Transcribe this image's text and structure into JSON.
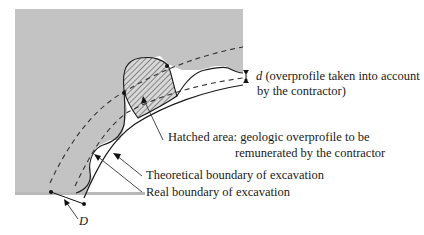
{
  "diagram": {
    "type": "excavation overprofile cross-section",
    "colors": {
      "rock": "#c3c3c3",
      "line": "#1a1a1a",
      "background": "#ffffff"
    },
    "labels": {
      "d_symbol": "d",
      "d_text_line1": " (overprofile taken into account",
      "d_text_line2": "by the contractor)",
      "hatched_line1": "Hatched area: geologic overprofile to be",
      "hatched_line2": "remunerated by the contractor",
      "theoretical": "Theoretical boundary of excavation",
      "real": "Real boundary of excavation",
      "D_symbol": "D"
    }
  }
}
